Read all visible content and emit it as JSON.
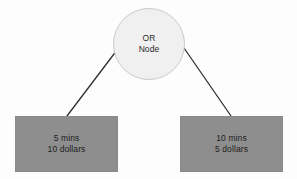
{
  "diagram": {
    "type": "and-or-decision-tree",
    "background_color": "#fdfdfd",
    "root": {
      "id": "or-node",
      "shape": "circle",
      "line1": "OR",
      "line2": "Node",
      "fill_color": "#f0f0f0",
      "border_color": "#c9c9c9",
      "text_color": "#2b2b2b",
      "center_x": 149,
      "center_y": 44,
      "diameter": 72
    },
    "children": [
      {
        "id": "option-left",
        "shape": "rectangle",
        "line1": "5 mins",
        "line2": "10 dollars",
        "fill_color": "#8e8e8e",
        "text_color": "#1d1d1d",
        "x": 15,
        "y": 116,
        "width": 103,
        "height": 56
      },
      {
        "id": "option-right",
        "shape": "rectangle",
        "line1": "10 mins",
        "line2": "5 dollars",
        "fill_color": "#8e8e8e",
        "text_color": "#1d1d1d",
        "x": 180,
        "y": 116,
        "width": 103,
        "height": 56
      }
    ],
    "edges": [
      {
        "id": "edge-root-to-left",
        "from": "or-node",
        "to": "option-left",
        "color": "#2e3033",
        "width": 1.3,
        "x1": 117,
        "y1": 50,
        "x2": 67,
        "y2": 116
      },
      {
        "id": "edge-root-to-right",
        "from": "or-node",
        "to": "option-right",
        "color": "#2e3033",
        "width": 1.3,
        "x1": 184,
        "y1": 48,
        "x2": 231,
        "y2": 116
      }
    ]
  }
}
